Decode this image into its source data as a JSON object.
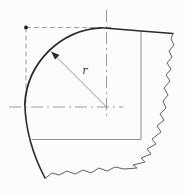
{
  "drawing": {
    "title": "rounded-corner-fillet-detail",
    "radius_label": "r"
  },
  "colors": {
    "background": "#fcfcfb",
    "outline": "#2a2a2a",
    "break_line": "#5f5f5f",
    "thin_line": "#909090",
    "centerline": "#8e8e8e",
    "phantom_line": "#9a9a9a",
    "dimension_line": "#8a8a8a",
    "arrow": "#2a2a2a",
    "corner_dot": "#1e1e1e",
    "label": "#3a3a3a"
  }
}
